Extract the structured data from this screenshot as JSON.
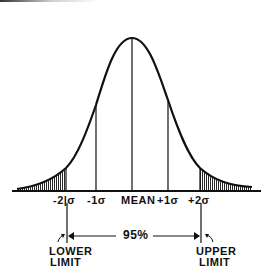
{
  "diagram": {
    "type": "normal-distribution-curve",
    "axis_labels": {
      "minus2": "-2|σ",
      "minus1": "-1σ",
      "mean": "MEAN",
      "plus1": "+1σ",
      "plus2": "+2σ"
    },
    "range_label": "95%",
    "lower_limit": [
      "LOWER",
      "LIMIT"
    ],
    "upper_limit": [
      "UPPER",
      "LIMIT"
    ],
    "colors": {
      "ink": "#111111",
      "background": "#ffffff"
    }
  }
}
